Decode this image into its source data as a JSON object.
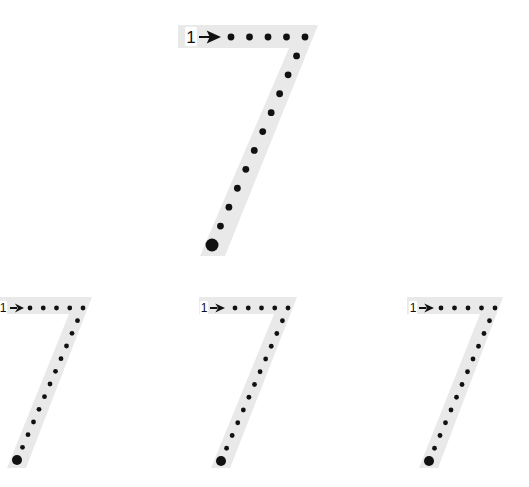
{
  "worksheet": {
    "title": "Trace the number 7",
    "digit": "7",
    "stroke_label": "1",
    "colors": {
      "band": "#e9e9e9",
      "dots": "#111111",
      "background": "#ffffff"
    },
    "figures": [
      {
        "name": "large-seven",
        "size": "large",
        "top_dots": 5,
        "diagonal_dots": 11,
        "start_marker": "arrow",
        "end_marker": "large-dot"
      },
      {
        "name": "small-seven-1",
        "size": "small",
        "top_dots": 5,
        "diagonal_dots": 12,
        "start_marker": "arrow",
        "end_marker": "large-dot"
      },
      {
        "name": "small-seven-2",
        "size": "small",
        "top_dots": 5,
        "diagonal_dots": 12,
        "start_marker": "arrow",
        "end_marker": "large-dot"
      },
      {
        "name": "small-seven-3",
        "size": "small",
        "top_dots": 5,
        "diagonal_dots": 12,
        "start_marker": "arrow",
        "end_marker": "large-dot"
      }
    ]
  }
}
